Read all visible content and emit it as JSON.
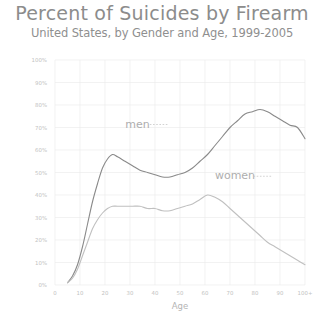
{
  "header": {
    "title": "Percent of Suicides by Firearm",
    "subtitle": "United States, by Gender and Age, 1999-2005"
  },
  "chart_data": {
    "type": "line",
    "title": "Percent of Suicides by Firearm",
    "subtitle": "United States, by Gender and Age, 1999-2005",
    "xlabel": "Age",
    "ylabel": "",
    "xlim": [
      0,
      100
    ],
    "ylim": [
      0,
      100
    ],
    "grid": true,
    "legend_position": "inline-annotation",
    "x_tick_labels": [
      "0",
      "10",
      "20",
      "30",
      "40",
      "50",
      "60",
      "70",
      "80",
      "90",
      "100+"
    ],
    "x_tick_values": [
      0,
      10,
      20,
      30,
      40,
      50,
      60,
      70,
      80,
      90,
      100
    ],
    "y_tick_labels": [
      "100%",
      "90%",
      "80%",
      "70%",
      "60%",
      "50%",
      "40%",
      "30%",
      "20%",
      "10%",
      "0%"
    ],
    "y_tick_values": [
      100,
      90,
      80,
      70,
      60,
      50,
      40,
      30,
      20,
      10,
      0
    ],
    "series": [
      {
        "name": "men",
        "color": "#8a8a8a",
        "x": [
          5,
          7,
          9,
          11,
          13,
          15,
          17,
          19,
          21,
          23,
          25,
          28,
          31,
          34,
          37,
          40,
          43,
          46,
          49,
          52,
          55,
          58,
          61,
          64,
          67,
          70,
          73,
          76,
          79,
          82,
          85,
          88,
          91,
          94,
          97,
          100
        ],
        "values": [
          1,
          4,
          9,
          17,
          27,
          37,
          45,
          52,
          56,
          58,
          57,
          55,
          53,
          51,
          50,
          49,
          48,
          48,
          49,
          50,
          52,
          55,
          58,
          62,
          66,
          70,
          73,
          76,
          77,
          78,
          77,
          75,
          73,
          71,
          70,
          65
        ]
      },
      {
        "name": "women",
        "color": "#c0c0c0",
        "x": [
          5,
          7,
          9,
          11,
          13,
          15,
          17,
          19,
          21,
          23,
          25,
          28,
          31,
          34,
          37,
          40,
          43,
          46,
          49,
          52,
          55,
          58,
          61,
          64,
          67,
          70,
          73,
          76,
          79,
          82,
          85,
          88,
          91,
          94,
          97,
          100
        ],
        "values": [
          1,
          3,
          7,
          13,
          19,
          25,
          29,
          32,
          34,
          35,
          35,
          35,
          35,
          35,
          34,
          34,
          33,
          33,
          34,
          35,
          36,
          38,
          40,
          39,
          37,
          34,
          31,
          28,
          25,
          22,
          19,
          17,
          15,
          13,
          11,
          9
        ]
      }
    ],
    "annotations": [
      {
        "text": "men",
        "x": 33,
        "y": 70
      },
      {
        "text": "women",
        "x": 72,
        "y": 47
      }
    ]
  }
}
